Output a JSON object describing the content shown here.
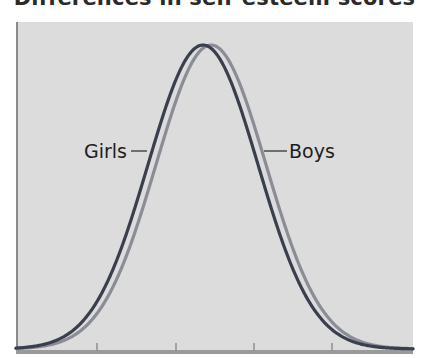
{
  "title": "Differences in self-esteem scores",
  "chart_data": {
    "type": "line",
    "title": "Differences in self-esteem scores",
    "title_note": "Title is clipped at the top edge; only letter bottoms are visible. Text inferred from letter shapes, not read directly.",
    "xlabel": "",
    "ylabel": "",
    "x_ticks_count": 4,
    "x_tick_labels": [],
    "grid": false,
    "legend": "direct labels on curves",
    "series": [
      {
        "name": "Girls",
        "color": "#3a3f4e",
        "shape": "normal distribution",
        "relative_mean": -0.15,
        "relative_sd": 1.0,
        "peak_height": 1.0
      },
      {
        "name": "Boys",
        "color": "#8a8d96",
        "shape": "normal distribution",
        "relative_mean": 0.15,
        "relative_sd": 1.0,
        "peak_height": 1.0
      }
    ]
  },
  "labels": {
    "girls": "Girls",
    "boys": "Boys"
  },
  "colors": {
    "background": "#dcdcdc",
    "girls": "#3a3f4e",
    "boys": "#8a8d96",
    "axis": "#7d7d7d"
  }
}
